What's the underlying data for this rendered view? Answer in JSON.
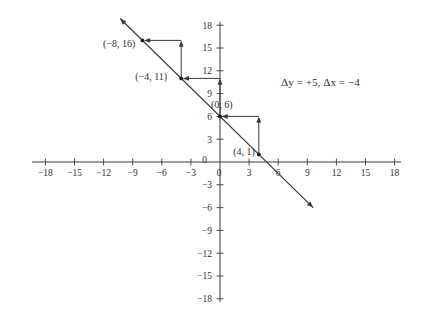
{
  "figure": {
    "background": "#ffffff",
    "ink": "#3b3b3b",
    "dot_color": "#1c1c1c"
  },
  "chart_data": {
    "type": "line",
    "title": "",
    "annotation": "Δy = +5, Δx = −4",
    "axes": {
      "xlim": [
        -18,
        18
      ],
      "ylim": [
        -18,
        18
      ],
      "tick_step": 3,
      "grid": false,
      "x_tick_labels": [
        "−18",
        "−15",
        "−12",
        "−9",
        "−6",
        "−3",
        "3",
        "6",
        "9",
        "12",
        "15",
        "18"
      ],
      "y_tick_labels": [
        "−18",
        "−15",
        "−12",
        "−9",
        "−6",
        "−3",
        "3",
        "6",
        "9",
        "12",
        "15",
        "18"
      ],
      "x_zero_label": "0",
      "y_zero_label": "0"
    },
    "line": {
      "slope": -1.25,
      "y_intercept": 6,
      "x_start": -10.3,
      "x_end": 9.6,
      "arrow_ends": "both"
    },
    "points": [
      {
        "x": -8,
        "y": 16,
        "label": "(−8, 16)",
        "label_side": "left-below"
      },
      {
        "x": -4,
        "y": 11,
        "label": "(−4, 11)",
        "label_side": "left"
      },
      {
        "x": 0,
        "y": 6,
        "label": "(0, 6)",
        "label_side": "above-left"
      },
      {
        "x": 4,
        "y": 1,
        "label": "(4, 1)",
        "label_side": "left-baseline"
      }
    ],
    "slope_steps": [
      {
        "from_x": 4,
        "from_y": 1,
        "rise_to_y": 6,
        "run_to_x": 0
      },
      {
        "from_x": 0,
        "from_y": 6,
        "rise_to_y": 11,
        "run_to_x": -4
      },
      {
        "from_x": -4,
        "from_y": 11,
        "rise_to_y": 16,
        "run_to_x": -8
      }
    ]
  }
}
